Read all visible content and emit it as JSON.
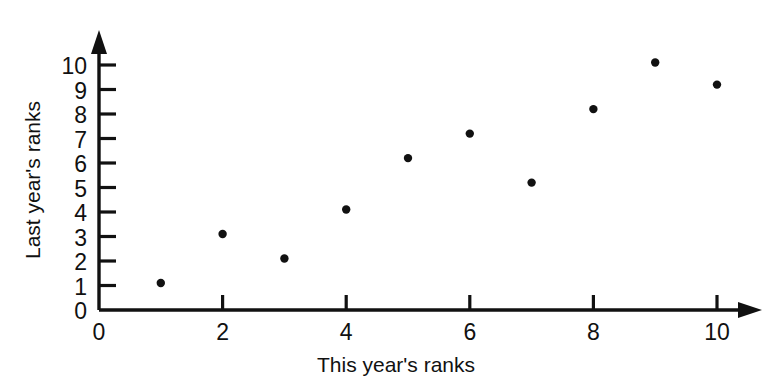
{
  "chart_data": {
    "type": "scatter",
    "title": "",
    "xlabel": "This year's ranks",
    "ylabel": "Last year's ranks",
    "xlim": [
      0,
      10.6
    ],
    "ylim": [
      0,
      10.6
    ],
    "grid": false,
    "legend": "none",
    "xticks": [
      "0",
      "2",
      "4",
      "6",
      "8",
      "10"
    ],
    "xtick_values": [
      0,
      2,
      4,
      6,
      8,
      10
    ],
    "xminor_ticks": [
      1,
      3,
      5,
      7,
      9
    ],
    "yticks": [
      "0",
      "1",
      "2",
      "3",
      "4",
      "5",
      "6",
      "7",
      "8",
      "9",
      "10"
    ],
    "ytick_values": [
      0,
      1,
      2,
      3,
      4,
      5,
      6,
      7,
      8,
      9,
      10
    ],
    "points": [
      {
        "x": 1,
        "y": 1.1
      },
      {
        "x": 2,
        "y": 3.1
      },
      {
        "x": 3,
        "y": 2.1
      },
      {
        "x": 4,
        "y": 4.1
      },
      {
        "x": 5,
        "y": 6.2
      },
      {
        "x": 6,
        "y": 7.2
      },
      {
        "x": 7,
        "y": 5.2
      },
      {
        "x": 8,
        "y": 8.2
      },
      {
        "x": 9,
        "y": 10.1
      },
      {
        "x": 10,
        "y": 9.2
      }
    ],
    "marker": "filled-circle",
    "marker_color": "#111111",
    "axis_color": "#111111",
    "background": "#ffffff"
  }
}
